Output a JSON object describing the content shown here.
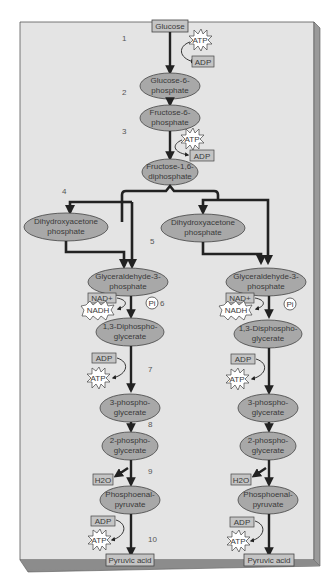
{
  "colors": {
    "panel": "#e4e4e4",
    "panel_edge_right": "#9a9a9a",
    "panel_edge_bottom": "#8c8c8c",
    "ellipse_fill": "#a8a8a8",
    "box_fill": "#c4c4c4",
    "arrow": "#222222",
    "text": "#3a3a3a"
  },
  "start": {
    "label": "Glucose"
  },
  "steps": [
    "1",
    "2",
    "3",
    "4",
    "5",
    "6",
    "7",
    "8",
    "9",
    "10"
  ],
  "trunk": {
    "g6p": [
      "Glucose-6-",
      "phosphate"
    ],
    "f6p": [
      "Fructose-6-",
      "phosphate"
    ],
    "f16dp": [
      "Fructose-1,6-",
      "diphosphate"
    ],
    "step1_in": "ATP",
    "step1_out": "ADP",
    "step3_in": "ATP",
    "step3_out": "ADP"
  },
  "left_branch": {
    "dhap": [
      "Dihydroxyacetone",
      "phosphate"
    ],
    "g3p": [
      "Glyceraldehyde-3-",
      "phosphate"
    ],
    "nad": "NAD+",
    "nadh": "NADH",
    "pi": "Pi",
    "bpg": [
      "1,3-Diphospho-",
      "glycerate"
    ],
    "adp1": "ADP",
    "atp1": "ATP",
    "pg3": [
      "3-phospho-",
      "glycerate"
    ],
    "pg2": [
      "2-phospho-",
      "glycerate"
    ],
    "h2o": "H2O",
    "pep": [
      "Phosphoenal-",
      "pyruvate"
    ],
    "adp2": "ADP",
    "atp2": "ATP",
    "end": "Pyruvic acid"
  },
  "right_branch": {
    "dhap": [
      "Dihydroxyacetone",
      "phosphate"
    ],
    "g3p": [
      "Glyceraldehyde-3-",
      "phosphate"
    ],
    "nad": "NAD+",
    "nadh": "NADH",
    "pi": "Pi",
    "bpg": [
      "1,3-Disphospho-",
      "glycerate"
    ],
    "adp1": "ADP",
    "atp1": "ATP",
    "pg3": [
      "3-phospho-",
      "glycerate"
    ],
    "pg2": [
      "2-phospho-",
      "glycerate"
    ],
    "h2o": "H2O",
    "pep": [
      "Phosphoenal-",
      "pyruvate"
    ],
    "adp2": "ADP",
    "atp2": "ATP",
    "end": "Pyruvic acid"
  }
}
